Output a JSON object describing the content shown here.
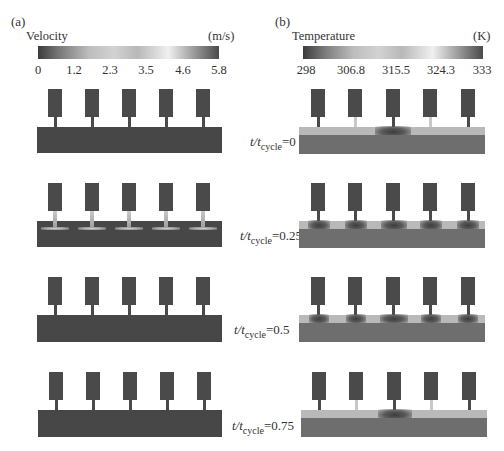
{
  "panels": {
    "a": {
      "label": "(a)",
      "colorbar": {
        "title": "Velocity",
        "unit": "(m/s)",
        "ticks": [
          "0",
          "1.2",
          "2.3",
          "3.5",
          "4.6",
          "5.8"
        ],
        "range": [
          0,
          5.8
        ]
      }
    },
    "b": {
      "label": "(b)",
      "colorbar": {
        "title": "Temperature",
        "unit": "(K)",
        "ticks": [
          "298",
          "306.8",
          "315.5",
          "324.3",
          "333"
        ],
        "range": [
          298,
          333
        ]
      }
    }
  },
  "time_labels": [
    {
      "prefix": "t/t",
      "sub": "cycle",
      "eq": "=",
      "value": "0"
    },
    {
      "prefix": "t/t",
      "sub": "cycle",
      "eq": "=",
      "value": "0.25"
    },
    {
      "prefix": "t/t",
      "sub": "cycle",
      "eq": "=",
      "value": "0.5"
    },
    {
      "prefix": "t/t",
      "sub": "cycle",
      "eq": "=",
      "value": "0.75"
    }
  ],
  "layout": {
    "electrode_count": 5,
    "colors": {
      "dark": "#4a4a4a",
      "base_temp": "#6e6e6e",
      "layer_temp": "#b9b9b9",
      "background": "#ffffff"
    }
  }
}
